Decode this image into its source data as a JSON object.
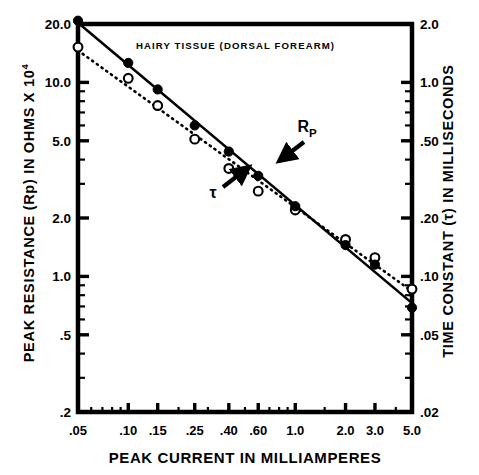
{
  "chart_data": {
    "type": "scatter",
    "title": "HAIRY TISSUE (DORSAL FOREARM)",
    "xlabel": "PEAK CURRENT IN MILLIAMPERES",
    "ylabel_left": "PEAK RESISTANCE (Rp) IN OHMS X 10",
    "ylabel_left_exponent": "4",
    "ylabel_right": "TIME CONSTANT (τ) IN MILLISECONDS",
    "xscale": "log",
    "yscale": "log",
    "xlim": [
      0.05,
      5.0
    ],
    "ylim_left": [
      0.2,
      20.0
    ],
    "ylim_right": [
      0.02,
      2.0
    ],
    "grid": false,
    "x_ticks": [
      ".05",
      ".10",
      ".15",
      ".25",
      ".40",
      ".60",
      "1.0",
      "2.0",
      "3.0",
      "5.0"
    ],
    "x_tick_values": [
      0.05,
      0.1,
      0.15,
      0.25,
      0.4,
      0.6,
      1.0,
      2.0,
      3.0,
      5.0
    ],
    "y_ticks_left": [
      "20.0",
      "10.0",
      "5.0",
      "2.0",
      "1.0",
      ".5",
      ".2"
    ],
    "y_tick_values_left": [
      20.0,
      10.0,
      5.0,
      2.0,
      1.0,
      0.5,
      0.2
    ],
    "y_ticks_right": [
      "2.0",
      "1.0",
      ".50",
      ".20",
      ".10",
      ".05",
      ".02"
    ],
    "y_tick_values_right": [
      2.0,
      1.0,
      0.5,
      0.2,
      0.1,
      0.05,
      0.02
    ],
    "series": [
      {
        "name": "Rp",
        "label": "Rp",
        "marker": "open-circle",
        "line": "dotted",
        "axis": "left",
        "x": [
          0.05,
          0.1,
          0.15,
          0.25,
          0.4,
          0.6,
          1.0,
          2.0,
          3.0,
          5.0
        ],
        "values": [
          15.2,
          10.5,
          7.6,
          5.1,
          3.6,
          2.75,
          2.2,
          1.55,
          1.25,
          0.86
        ]
      },
      {
        "name": "tau",
        "label": "τ",
        "marker": "filled-circle",
        "line": "solid",
        "axis": "right",
        "x": [
          0.05,
          0.1,
          0.15,
          0.25,
          0.4,
          0.6,
          1.0,
          2.0,
          3.0,
          5.0
        ],
        "values": [
          2.08,
          1.26,
          0.92,
          0.6,
          0.44,
          0.33,
          0.23,
          0.145,
          0.115,
          0.069
        ]
      }
    ],
    "annotations": [
      {
        "text": "Rp",
        "name": "rp-annotation",
        "x_px": 307,
        "y_px": 132,
        "arrow": {
          "x1": 304,
          "y1": 142,
          "x2": 279,
          "y2": 161
        }
      },
      {
        "text": "τ",
        "name": "tau-annotation",
        "x_px": 213,
        "y_px": 198,
        "arrow": {
          "x1": 223,
          "y1": 187,
          "x2": 249,
          "y2": 167
        }
      }
    ]
  },
  "colors": {
    "background": "#ffffff",
    "foreground": "#000000"
  }
}
